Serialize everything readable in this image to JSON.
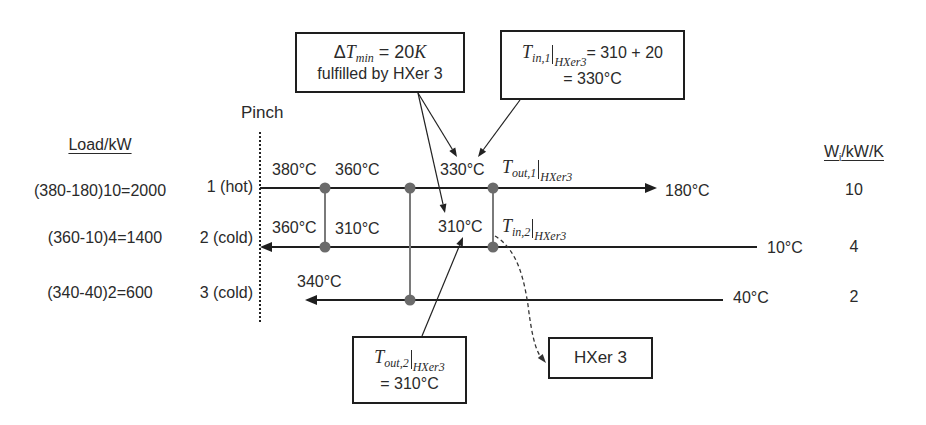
{
  "diagram": {
    "pinch_label": "Pinch",
    "load_header": "Load/kW",
    "w_header": {
      "main": "W",
      "sub": "i",
      "rest": "/kW/K"
    },
    "streams": [
      {
        "name": "1 (hot)",
        "type": "hot",
        "load": "(380-180)10=2000",
        "w": "10",
        "end_temp": "180°C"
      },
      {
        "name": "2 (cold)",
        "type": "cold",
        "load": "(360-10)4=1400",
        "w": "4",
        "end_temp": "10°C"
      },
      {
        "name": "3 (cold)",
        "type": "cold",
        "load": "(340-40)2=600",
        "w": "2",
        "end_temp": "40°C"
      }
    ],
    "temps": {
      "s1_pinch": "380°C",
      "s1_hx1": "360°C",
      "s1_hx3": "330°C",
      "s2_pinch": "360°C",
      "s2_hx1": "310°C",
      "s2_hx3": "310°C",
      "s3_pinch": "340°C"
    },
    "inline_math": {
      "t_out_1": {
        "symbol": "T",
        "sub": "out,1",
        "eval_sub": "HXer3"
      },
      "t_in_2": {
        "symbol": "T",
        "sub": "in,2",
        "eval_sub": "HXer3"
      }
    },
    "callouts": {
      "dtmin": {
        "prefix": "Δ",
        "symbol": "T",
        "sub": "min",
        "rest": " = 20",
        "unit": "K",
        "line2": "fulfilled by HXer 3"
      },
      "t_in_1": {
        "symbol": "T",
        "sub": "in,1",
        "eval_sub": "HXer3",
        "rest": "= 310 + 20",
        "line2": "= 330°C"
      },
      "t_out_2": {
        "symbol": "T",
        "sub": "out,2",
        "eval_sub": "HXer3",
        "line2": "= 310°C"
      },
      "hxer3": {
        "label": "HXer 3"
      }
    },
    "colors": {
      "line": "#1e1e1e",
      "connector": "#7a7a7a",
      "node": "#6b6b6b",
      "text": "#2a2a2a"
    }
  }
}
